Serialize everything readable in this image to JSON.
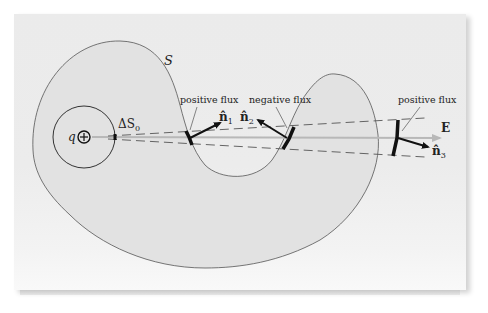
{
  "figure": {
    "surface_label": "S",
    "charge_label": "q",
    "charge_symbol": "⊕",
    "patch_label": "ΔS",
    "patch_subscript": "0",
    "field_label": "E",
    "annotations": [
      {
        "id": "flux1",
        "text": "positive flux"
      },
      {
        "id": "flux2",
        "text": "negative flux"
      },
      {
        "id": "flux3",
        "text": "positive flux"
      }
    ],
    "normals": [
      {
        "id": "n1",
        "symbol": "n̂",
        "subscript": "1"
      },
      {
        "id": "n2",
        "symbol": "n̂",
        "subscript": "2"
      },
      {
        "id": "n3",
        "symbol": "n̂",
        "subscript": "3"
      }
    ],
    "colors": {
      "page": "#ebebeb",
      "surface_fill": "#e2e2e2",
      "outline": "#555555",
      "field_line": "#b8b8b8",
      "ink": "#111111"
    }
  }
}
